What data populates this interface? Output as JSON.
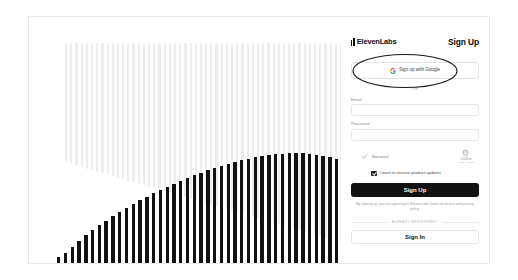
{
  "brand": {
    "name": "ElevenLabs",
    "logo_icon": "elevenlabs-bars-icon"
  },
  "header": {
    "title": "Sign Up"
  },
  "oauth": {
    "google_label": "Sign up with Google",
    "google_icon": "google-g-icon"
  },
  "divider": {
    "or": "OR"
  },
  "form": {
    "fields": [
      {
        "label": "Email",
        "value": "",
        "placeholder": ""
      },
      {
        "label": "Password",
        "value": "",
        "placeholder": ""
      }
    ]
  },
  "captcha": {
    "status_text": "Success!",
    "check_icon": "check-icon",
    "provider_icon": "cloudflare-icon",
    "provider_name": "Cloudflare",
    "links": "Privacy • Terms"
  },
  "marketing": {
    "checkbox_label": "I want to receive product updates",
    "checked": true
  },
  "actions": {
    "submit_label": "Sign Up",
    "signin_label": "Sign In"
  },
  "legal": {
    "prefix": "By signing up, you are agreeing to ElevenLabs' ",
    "terms_link": "terms of",
    "middle": " ",
    "terms_link2": "service",
    "and": " and ",
    "privacy_link": "privacy policy",
    "suffix": ".",
    "full": "By signing up, you are agreeing to ElevenLabs' terms of service and privacy policy."
  },
  "alt_auth": {
    "divider_text": "ALREADY REGISTERED?"
  },
  "colors": {
    "accent": "#121212",
    "border": "#e6e6e6",
    "muted_text": "#9d9d9d",
    "waveform_light": "#eceded",
    "waveform_dark": "#121212",
    "annotation": "#1a1a1a"
  },
  "visualization": {
    "type": "audio-waveform",
    "light_bars": [
      118,
      120,
      122,
      124,
      126,
      127,
      129,
      130,
      132,
      133,
      135,
      136,
      138,
      139,
      141,
      142,
      144,
      145,
      147,
      148,
      150,
      151,
      153,
      154,
      156,
      157,
      159,
      160,
      162,
      163,
      165,
      166,
      168,
      169,
      171,
      172,
      174,
      175,
      177,
      178,
      180,
      181,
      183,
      184,
      186,
      187,
      189,
      190,
      192,
      193,
      195,
      196,
      198,
      199,
      200,
      200,
      200,
      200,
      200,
      200,
      200,
      200,
      200,
      200,
      200,
      200,
      200,
      200,
      200,
      200,
      200,
      200,
      200,
      200,
      200,
      200,
      200,
      200,
      200,
      200,
      200,
      200,
      200,
      200,
      200,
      200,
      200,
      200,
      200,
      200,
      200,
      200,
      200,
      200,
      200,
      200
    ],
    "dark_bars": [
      6,
      10,
      16,
      22,
      28,
      33,
      38,
      42,
      47,
      51,
      55,
      59,
      63,
      66,
      70,
      73,
      76,
      79,
      82,
      85,
      88,
      90,
      93,
      95,
      97,
      99,
      101,
      103,
      104,
      106,
      107,
      108,
      109,
      109,
      110,
      110,
      110,
      109,
      108,
      107,
      106,
      104,
      102,
      100,
      98,
      95,
      92,
      89,
      86,
      82,
      78,
      74,
      70,
      65,
      60,
      55,
      50,
      44,
      38,
      32,
      26,
      20,
      13,
      6
    ]
  }
}
